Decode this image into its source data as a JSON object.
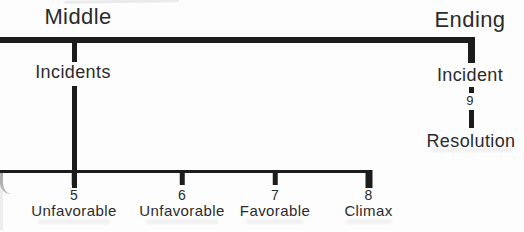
{
  "colors": {
    "line": "#1c1c1c",
    "text": "#2b2b2b",
    "background": "#fdfdfd"
  },
  "sections": {
    "middle": {
      "title": "Middle",
      "branch_label": "Incidents"
    },
    "ending": {
      "title": "Ending",
      "branch_label": "Incident",
      "point_number": "9",
      "resolution_label": "Resolution"
    }
  },
  "scale": {
    "ticks": [
      {
        "number": "5",
        "label": "Unfavorable"
      },
      {
        "number": "6",
        "label": "Unfavorable"
      },
      {
        "number": "7",
        "label": "Favorable"
      },
      {
        "number": "8",
        "label": "Climax"
      }
    ]
  }
}
